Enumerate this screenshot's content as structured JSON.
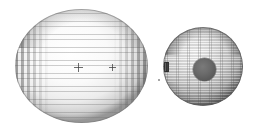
{
  "scene": {
    "background_color": "#ffffff",
    "width": 254,
    "height": 132,
    "caption": ""
  },
  "bodies": [
    {
      "id": "left-body",
      "name": "large-wireframe-sphere",
      "shape": "sphere",
      "render_style": "wireframe-mesh",
      "bbox": {
        "x": 15,
        "y": 9,
        "width": 133,
        "height": 114
      },
      "center": {
        "x": 81,
        "y": 66
      },
      "radius_px": 66,
      "fill_color": "#fafafa",
      "limb_color": "#1a1a1a",
      "mesh_color": "#5a5a5a",
      "label": "",
      "markers": [
        {
          "name": "marker-cross-primary",
          "x": 78,
          "y": 67,
          "size": 9,
          "label": ""
        },
        {
          "name": "marker-cross-secondary",
          "x": 112,
          "y": 67,
          "size": 7,
          "label": ""
        }
      ]
    },
    {
      "id": "right-body",
      "name": "small-shaded-ellipsoid",
      "shape": "ellipsoid",
      "render_style": "shaded-surface",
      "bbox": {
        "x": 163,
        "y": 27,
        "width": 80,
        "height": 79
      },
      "center": {
        "x": 203,
        "y": 66
      },
      "fill_color": "#cfcfcf",
      "limb_color": "#151515",
      "label": "",
      "features": [
        {
          "name": "crater-spot",
          "type": "circular-dark-region",
          "x": 193,
          "y": 58,
          "diameter": 23,
          "color": "#606060",
          "label": ""
        },
        {
          "name": "limb-tab",
          "type": "rectangular-marker",
          "x": 164,
          "y": 62,
          "width": 5,
          "height": 10,
          "color": "#2a2a2a",
          "label": ""
        }
      ]
    }
  ],
  "annotations": {
    "speck": {
      "name": "faint-speck",
      "x": 158,
      "y": 79,
      "color": "#969696"
    }
  }
}
